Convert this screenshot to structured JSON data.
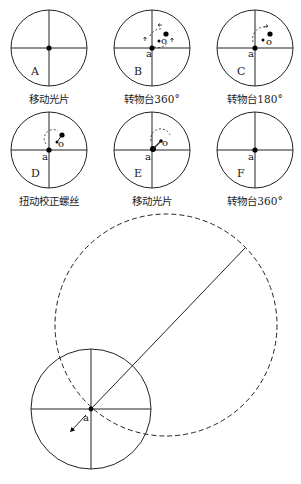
{
  "panels": [
    {
      "letter": "A",
      "caption": "移动光片",
      "cx": 49,
      "cy": 48
    },
    {
      "letter": "B",
      "caption": "转物台360°",
      "cx": 152,
      "cy": 48
    },
    {
      "letter": "C",
      "caption": "转物台180°",
      "cx": 255,
      "cy": 48
    },
    {
      "letter": "D",
      "caption": "扭动校正螺丝",
      "cx": 49,
      "cy": 150
    },
    {
      "letter": "E",
      "caption": "移动光片",
      "cx": 152,
      "cy": 150
    },
    {
      "letter": "F",
      "caption": "转物台360°",
      "cx": 255,
      "cy": 150
    }
  ],
  "point_labels": {
    "a": "a",
    "o": "o"
  },
  "bottom_figure": {
    "small_circle": {
      "cx": 91,
      "cy": 409,
      "r": 60
    },
    "dashed_circle": {
      "cx": 166,
      "cy": 325,
      "r": 111
    },
    "point_label": "a"
  }
}
